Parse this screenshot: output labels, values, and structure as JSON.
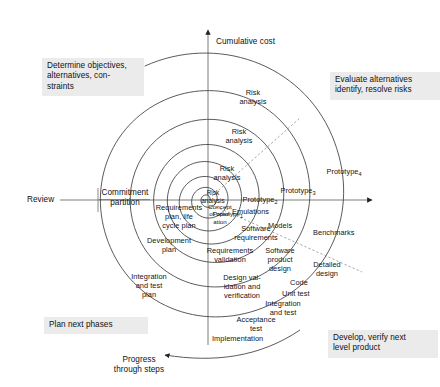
{
  "figure": {
    "type": "spiral-model-diagram"
  },
  "axes": {
    "vertical_label": "Cumulative cost",
    "horizontal_left_label": "Review",
    "progress_label": "Progress\nthrough steps",
    "partition_label": "Commitment\npartition"
  },
  "quadrants": [
    {
      "id": "determine-objectives",
      "label": "Determine objectives,\nalternatives, con-\nstraints",
      "position": "top-left"
    },
    {
      "id": "evaluate-alternatives",
      "label": "Evaluate alternatives\nidentify, resolve risks",
      "position": "top-right"
    },
    {
      "id": "plan-next-phases",
      "label": "Plan next phases",
      "position": "bottom-left"
    },
    {
      "id": "develop-verify",
      "label": "Develop, verify next\nlevel product",
      "position": "bottom-right"
    }
  ],
  "stages": {
    "risk_analysis_1": "Risk\nanalysis",
    "risk_analysis_2": "Risk\nanalysis",
    "risk_analysis_3": "Risk\nanalysis",
    "risk_analysis_4": "Risk\nanalysis",
    "prototype_1": "Prototype",
    "prototype_1_sub": "1",
    "prototype_2": "Prototype",
    "prototype_2_sub": "2",
    "prototype_3": "Prototype",
    "prototype_3_sub": "3",
    "prototype_4": "Prototype",
    "prototype_4_sub": "4",
    "concept_of_operation": "Concept\nof oper-\nation",
    "emulations": "Emulations",
    "models": "Models",
    "benchmarks": "Benchmarks",
    "software_requirements": "Software\nrequirements",
    "software_product_design": "Software\nproduct\ndesign",
    "detailed_design": "Detailed\ndesign",
    "requirements_validation": "Requirements\nvalidation",
    "design_validation": "Design val-\nidation and\nverification",
    "code": "Code",
    "unit_test": "Unit test",
    "integration_and_test": "Integration\nand test",
    "acceptance_test": "Acceptance\ntest",
    "implementation": "Implementation",
    "requirements_plan": "Requirements\nplan, life\ncycle plan",
    "development_plan": "Development\nplan",
    "integration_and_test_plan": "Integration\nand test\nplan"
  },
  "colors": {
    "line": "#3d3d3d",
    "text": "#141414",
    "caption_background": "#ebebeb",
    "page_background": "#ffffff"
  }
}
